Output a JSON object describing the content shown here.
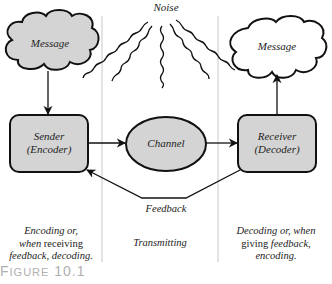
{
  "diagram": {
    "noise_label": "Noise",
    "nodes": {
      "sender_message": "Message",
      "receiver_message": "Message",
      "sender_line1": "Sender",
      "sender_line2": "(Encoder)",
      "channel": "Channel",
      "receiver_line1": "Receiver",
      "receiver_line2": "(Decoder)"
    },
    "feedback_label": "Feedback",
    "columns": {
      "left": {
        "line1": "Encoding or,",
        "line2_pre": "when ",
        "line2_up": "receiving",
        "line3": "feedback, decoding."
      },
      "middle": {
        "line1": "Transmitting"
      },
      "right": {
        "line1": "Decoding or, when",
        "line2_up": "giving",
        "line2_post": " feedback,",
        "line3": "encoding."
      }
    },
    "figure_caption": {
      "first": "F",
      "rest": "IGURE",
      "number": " 10.1"
    },
    "colors": {
      "fill_gray": "#d4d4d4",
      "stroke": "#111111",
      "divider": "#c8c8c8",
      "caption": "#b0b0b0"
    }
  }
}
